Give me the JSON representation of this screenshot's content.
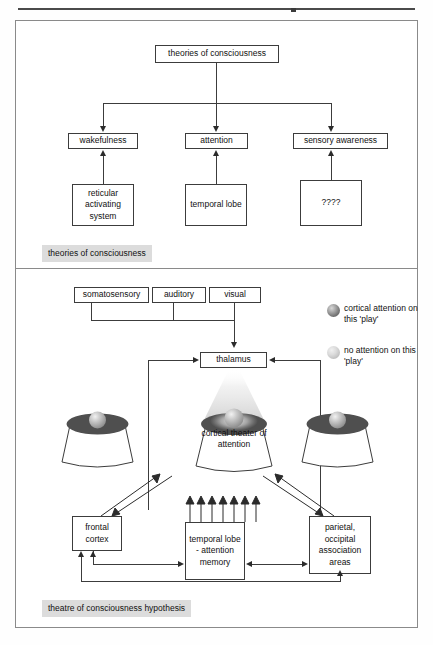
{
  "figure": {
    "panels": [
      {
        "id": "theories-of-consciousness",
        "caption": "theories of consciousness",
        "nodes": {
          "root": "theories of consciousness",
          "branch_1": "wakefulness",
          "branch_2": "attention",
          "branch_3": "sensory awareness",
          "leaf_1": "reticular activating system",
          "leaf_2": "temporal lobe",
          "leaf_3": "????"
        }
      },
      {
        "id": "theatre-of-consciousness-hypothesis",
        "caption": "theatre of consciousness hypothesis",
        "nodes": {
          "input_1": "somatosensory",
          "input_2": "auditory",
          "input_3": "visual",
          "hub": "thalamus",
          "stage_center": "cortical theater of attention",
          "bottom_1": "frontal cortex",
          "bottom_2": "temporal lobe - attention memory",
          "bottom_3": "parietal, occipital association areas"
        },
        "legend": [
          {
            "swatch": "dark-sphere",
            "label": "cortical attention on this 'play'"
          },
          {
            "swatch": "light-sphere",
            "label": "no attention on this 'play'"
          }
        ]
      }
    ]
  },
  "colors": {
    "frame_border": "#8a8a8a",
    "box_border": "#3c3c3c",
    "caption_background": "#dcdcdc",
    "stage_top_dark": "#4f4f4f",
    "text": "#111111"
  }
}
